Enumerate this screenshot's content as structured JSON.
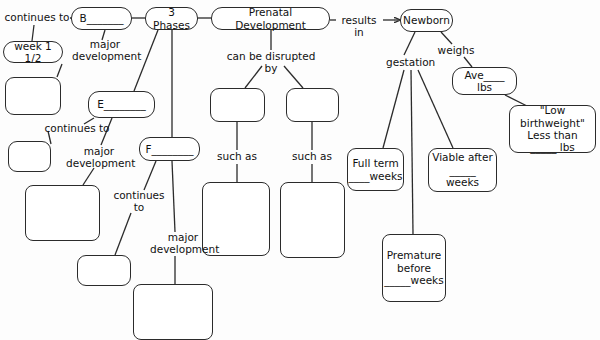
{
  "diagram": {
    "stroke_color": "#2b2b2b",
    "background_color": "#fdfdfd",
    "nodes": [
      {
        "id": "week1",
        "text": "week 1 1/2",
        "x": 3,
        "y": 41,
        "w": 60,
        "h": 22,
        "shape": "round"
      },
      {
        "id": "blank_left_1",
        "text": "",
        "x": 5,
        "y": 77,
        "w": 56,
        "h": 38,
        "shape": "soft"
      },
      {
        "id": "blank_left_2",
        "text": "",
        "x": 8,
        "y": 141,
        "w": 43,
        "h": 31,
        "shape": "soft"
      },
      {
        "id": "blank_left_3",
        "text": "",
        "x": 25,
        "y": 185,
        "w": 75,
        "h": 56,
        "shape": "box"
      },
      {
        "id": "blank_left_4",
        "text": "",
        "x": 77,
        "y": 255,
        "w": 54,
        "h": 31,
        "shape": "soft"
      },
      {
        "id": "blank_left_5",
        "text": "",
        "x": 133,
        "y": 284,
        "w": 80,
        "h": 56,
        "shape": "box"
      },
      {
        "id": "node_b",
        "text": "B_______",
        "x": 71,
        "y": 7,
        "w": 61,
        "h": 23,
        "shape": "round"
      },
      {
        "id": "node_e",
        "text": "E________",
        "x": 88,
        "y": 91,
        "w": 67,
        "h": 27,
        "shape": "round"
      },
      {
        "id": "node_f",
        "text": "F________",
        "x": 139,
        "y": 137,
        "w": 61,
        "h": 24,
        "shape": "round"
      },
      {
        "id": "three_phases",
        "text": "3 Phases",
        "x": 145,
        "y": 7,
        "w": 53,
        "h": 23,
        "shape": "round"
      },
      {
        "id": "prenatal_development",
        "text": "Prenatal Development",
        "x": 211,
        "y": 7,
        "w": 119,
        "h": 23,
        "shape": "round"
      },
      {
        "id": "blank_mid_1",
        "text": "",
        "x": 210,
        "y": 88,
        "w": 55,
        "h": 34,
        "shape": "soft"
      },
      {
        "id": "blank_mid_2",
        "text": "",
        "x": 286,
        "y": 88,
        "w": 53,
        "h": 34,
        "shape": "soft"
      },
      {
        "id": "blank_mid_3",
        "text": "",
        "x": 202,
        "y": 182,
        "w": 68,
        "h": 74,
        "shape": "box"
      },
      {
        "id": "blank_mid_4",
        "text": "",
        "x": 280,
        "y": 182,
        "w": 65,
        "h": 76,
        "shape": "box"
      },
      {
        "id": "newborn",
        "text": "Newborn",
        "x": 400,
        "y": 9,
        "w": 53,
        "h": 23,
        "shape": "round"
      },
      {
        "id": "ave_lbs",
        "text": "Ave____ lbs",
        "x": 452,
        "y": 67,
        "w": 65,
        "h": 28,
        "shape": "round"
      },
      {
        "id": "low_birthweight",
        "text": "\"Low birthweight\"\nLess than\n_____ lbs",
        "x": 509,
        "y": 105,
        "w": 87,
        "h": 48,
        "shape": "soft"
      },
      {
        "id": "full_term",
        "text": "Full term\n____weeks",
        "x": 347,
        "y": 148,
        "w": 57,
        "h": 43,
        "shape": "soft"
      },
      {
        "id": "viable_after",
        "text": "Viable after\n_____ weeks",
        "x": 428,
        "y": 148,
        "w": 69,
        "h": 44,
        "shape": "soft"
      },
      {
        "id": "premature",
        "text": "Premature\nbefore\n_____weeks",
        "x": 382,
        "y": 234,
        "w": 64,
        "h": 68,
        "shape": "box"
      }
    ],
    "labels": [
      {
        "id": "continues_to_1",
        "text": "continues to",
        "x": 4,
        "y": 11,
        "w": 66
      },
      {
        "id": "major_development_1",
        "text": "major\ndevelopment",
        "x": 72,
        "y": 38,
        "w": 66
      },
      {
        "id": "continues_to_2",
        "text": "continues to",
        "x": 44,
        "y": 122,
        "w": 66
      },
      {
        "id": "major_development_2",
        "text": "major\ndevelopment",
        "x": 66,
        "y": 145,
        "w": 66
      },
      {
        "id": "continues_to_3",
        "text": "continues\nto",
        "x": 110,
        "y": 189,
        "w": 58
      },
      {
        "id": "major_development_3",
        "text": "major\ndevelopment",
        "x": 150,
        "y": 231,
        "w": 66
      },
      {
        "id": "can_be_disrupted_by",
        "text": "can be disrupted by",
        "x": 219,
        "y": 50,
        "w": 104
      },
      {
        "id": "such_as_1",
        "text": "such as",
        "x": 216,
        "y": 150,
        "w": 42
      },
      {
        "id": "such_as_2",
        "text": "such as",
        "x": 291,
        "y": 150,
        "w": 42
      },
      {
        "id": "results_in",
        "text": "results in",
        "x": 335,
        "y": 14,
        "w": 48
      },
      {
        "id": "weighs",
        "text": "weighs",
        "x": 437,
        "y": 44,
        "w": 38
      },
      {
        "id": "gestation",
        "text": "gestation",
        "x": 386,
        "y": 56,
        "w": 48
      }
    ],
    "edges": [
      {
        "id": "edge-continues-to-1-to-b",
        "from": "continues_to_1",
        "to": "node_b",
        "x1": 70,
        "y1": 18,
        "x2": 71,
        "y2": 18
      },
      {
        "id": "edge-continues-to-1-to-week1",
        "from": "continues_to_1",
        "to": "week1",
        "x1": 34,
        "y1": 25,
        "x2": 32,
        "y2": 41
      },
      {
        "id": "edge-b-to-major-1",
        "from": "node_b",
        "to": "major_development_1",
        "x1": 105,
        "y1": 30,
        "x2": 102,
        "y2": 40
      },
      {
        "id": "edge-b-to-3phases",
        "from": "node_b",
        "to": "three_phases",
        "x1": 132,
        "y1": 18,
        "x2": 145,
        "y2": 18
      },
      {
        "id": "edge-3phases-to-prenatal",
        "from": "three_phases",
        "to": "prenatal_development",
        "x1": 198,
        "y1": 18,
        "x2": 211,
        "y2": 18
      },
      {
        "id": "edge-3phases-to-e",
        "from": "three_phases",
        "to": "node_e",
        "x1": 158,
        "y1": 30,
        "x2": 134,
        "y2": 91
      },
      {
        "id": "edge-3phases-to-f",
        "from": "three_phases",
        "to": "node_f",
        "x1": 172,
        "y1": 30,
        "x2": 172,
        "y2": 137
      },
      {
        "id": "edge-e-to-continues-2",
        "from": "node_e",
        "to": "continues_to_2",
        "x1": 94,
        "y1": 118,
        "x2": 84,
        "y2": 124
      },
      {
        "id": "edge-continues-2-to-blank",
        "from": "continues_to_2",
        "to": "blank_left_2",
        "x1": 48,
        "y1": 131,
        "x2": 51,
        "y2": 144
      },
      {
        "id": "edge-e-to-major-2",
        "from": "node_e",
        "to": "major_development_2",
        "x1": 112,
        "y1": 118,
        "x2": 101,
        "y2": 145
      },
      {
        "id": "edge-major-2-to-blank",
        "from": "major_development_2",
        "to": "blank_left_3",
        "x1": 94,
        "y1": 168,
        "x2": 83,
        "y2": 185
      },
      {
        "id": "edge-week1-to-blank",
        "from": "week1",
        "to": "blank_left_1",
        "x1": 62,
        "y1": 64,
        "x2": 57,
        "y2": 77
      },
      {
        "id": "edge-f-to-continues-3",
        "from": "node_f",
        "to": "continues_to_3",
        "x1": 156,
        "y1": 161,
        "x2": 144,
        "y2": 190
      },
      {
        "id": "edge-continues-3-to-blank",
        "from": "continues_to_3",
        "to": "blank_left_4",
        "x1": 131,
        "y1": 213,
        "x2": 115,
        "y2": 255
      },
      {
        "id": "edge-f-to-major-3",
        "from": "node_f",
        "to": "major_development_3",
        "x1": 172,
        "y1": 161,
        "x2": 175,
        "y2": 232
      },
      {
        "id": "edge-major-3-to-blank",
        "from": "major_development_3",
        "to": "blank_left_5",
        "x1": 175,
        "y1": 256,
        "x2": 175,
        "y2": 284
      },
      {
        "id": "edge-prenatal-to-disrupted",
        "from": "prenatal_development",
        "to": "can_be_disrupted_by",
        "x1": 271,
        "y1": 30,
        "x2": 271,
        "y2": 50
      },
      {
        "id": "edge-disrupted-to-blank1",
        "from": "can_be_disrupted_by",
        "to": "blank_mid_1",
        "x1": 262,
        "y1": 66,
        "x2": 245,
        "y2": 88
      },
      {
        "id": "edge-disrupted-to-blank2",
        "from": "can_be_disrupted_by",
        "to": "blank_mid_2",
        "x1": 284,
        "y1": 66,
        "x2": 303,
        "y2": 88
      },
      {
        "id": "edge-blank1-to-suchas1",
        "from": "blank_mid_1",
        "to": "such_as_1",
        "x1": 237,
        "y1": 122,
        "x2": 237,
        "y2": 150
      },
      {
        "id": "edge-suchas1-to-blank3",
        "from": "such_as_1",
        "to": "blank_mid_3",
        "x1": 237,
        "y1": 164,
        "x2": 237,
        "y2": 182
      },
      {
        "id": "edge-blank2-to-suchas2",
        "from": "blank_mid_2",
        "to": "such_as_2",
        "x1": 312,
        "y1": 122,
        "x2": 312,
        "y2": 150
      },
      {
        "id": "edge-suchas2-to-blank4",
        "from": "such_as_2",
        "to": "blank_mid_4",
        "x1": 312,
        "y1": 164,
        "x2": 312,
        "y2": 182
      },
      {
        "id": "edge-prenatal-to-resultsin",
        "from": "prenatal_development",
        "to": "results_in",
        "x1": 330,
        "y1": 20,
        "x2": 336,
        "y2": 20
      },
      {
        "id": "edge-newborn-to-gestation",
        "from": "newborn",
        "to": "gestation",
        "x1": 415,
        "y1": 32,
        "x2": 404,
        "y2": 55
      },
      {
        "id": "edge-newborn-to-weighs",
        "from": "newborn",
        "to": "weighs",
        "x1": 441,
        "y1": 32,
        "x2": 452,
        "y2": 44
      },
      {
        "id": "edge-weighs-to-ave",
        "from": "weighs",
        "to": "ave_lbs",
        "x1": 464,
        "y1": 57,
        "x2": 472,
        "y2": 67
      },
      {
        "id": "edge-ave-to-lowbirth",
        "from": "ave_lbs",
        "to": "low_birthweight",
        "x1": 505,
        "y1": 95,
        "x2": 527,
        "y2": 106
      },
      {
        "id": "edge-gestation-to-fullterm",
        "from": "gestation",
        "to": "full_term",
        "x1": 404,
        "y1": 70,
        "x2": 383,
        "y2": 148
      },
      {
        "id": "edge-gestation-to-premature",
        "from": "gestation",
        "to": "premature",
        "x1": 411,
        "y1": 70,
        "x2": 413,
        "y2": 234
      },
      {
        "id": "edge-gestation-to-viable",
        "from": "gestation",
        "to": "viable_after",
        "x1": 418,
        "y1": 70,
        "x2": 453,
        "y2": 148
      }
    ],
    "arrows": [
      {
        "id": "arrow-results-in-to-newborn",
        "x1": 383,
        "y1": 20,
        "x2": 400,
        "y2": 20
      }
    ]
  }
}
